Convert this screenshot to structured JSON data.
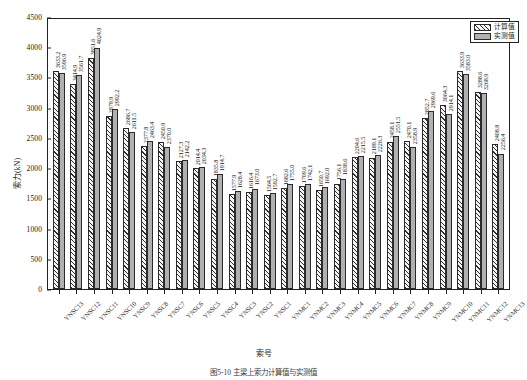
{
  "chart_data": {
    "type": "bar",
    "title": "",
    "xlabel": "索号",
    "ylabel": "索力(kN)",
    "ylim": [
      0,
      4500
    ],
    "yticks": [
      0,
      500,
      1000,
      1500,
      2000,
      2500,
      3000,
      3500,
      4000,
      4500
    ],
    "grid": false,
    "legend_position": "top-right",
    "categories": [
      "YNSC13",
      "YNSC12",
      "YNSC11",
      "YNSC10",
      "YNSC9",
      "YNSC8",
      "YNSC7",
      "YNSC6",
      "YNSC5",
      "YNSC4",
      "YNSC3",
      "YNSC2",
      "YNSC1",
      "YNMC1",
      "YNMC2",
      "YNMC3",
      "YNMC4",
      "YNMC5",
      "YNMC6",
      "YNMC7",
      "YNMC8",
      "YNMC9",
      "YNMC10",
      "YNMC11",
      "YNMC12",
      "YNMC13"
    ],
    "series": [
      {
        "name": "计算值",
        "values": [
          3633.2,
          3414.9,
          3851.6,
          2879.9,
          2686.7,
          2377.8,
          2450.9,
          2127.3,
          2014.4,
          1835.8,
          1577.9,
          1616.4,
          1564.5,
          1682.6,
          1709.6,
          1650.7,
          1756.1,
          2204.6,
          2189.1,
          2458.1,
          2470.1,
          2852.7,
          3064.3,
          3633.9,
          3288.6,
          2408.8
        ]
      },
      {
        "name": "实测值",
        "values": [
          3596.9,
          3561.7,
          4024.9,
          2992.2,
          2611.5,
          2463.4,
          2370.0,
          2142.2,
          2034.3,
          1914.7,
          1628.4,
          1673.0,
          1592.7,
          1755.0,
          1742.1,
          1692.0,
          1838.6,
          2215.5,
          2226.3,
          2551.5,
          2358.9,
          2969.6,
          2914.1,
          3583.0,
          3268.9,
          2256.4
        ]
      }
    ]
  },
  "legend": {
    "items": [
      {
        "label": "计算值",
        "pattern": "diagonal-hatch"
      },
      {
        "label": "实测值",
        "pattern": "solid-gray"
      }
    ]
  },
  "caption": "图5-10  主梁上索力计算值与实测值",
  "colors": {
    "calculated_fill": "#f4f4f4",
    "calculated_hatch": "#2f2f2f",
    "measured_fill": "#b0b0b0",
    "axis": "#222222"
  }
}
